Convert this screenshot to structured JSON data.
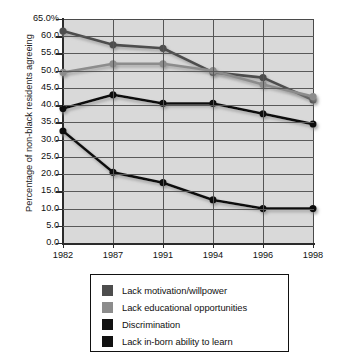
{
  "chart_data": {
    "type": "line",
    "title": "",
    "xlabel": "",
    "ylabel": "Percentage of non-black residents agreeing",
    "categories": [
      "1982",
      "1987",
      "1991",
      "1994",
      "1996",
      "1998"
    ],
    "ylim": [
      0.0,
      65.0
    ],
    "ytick_labels": [
      "65.0%",
      "60.0",
      "55.0",
      "50.0",
      "45.0",
      "40.0",
      "35.0",
      "30.0",
      "25.0",
      "20.0",
      "15.0",
      "10.0",
      "5.0",
      "0.0"
    ],
    "ytick_values": [
      65.0,
      60.0,
      55.0,
      50.0,
      45.0,
      40.0,
      35.0,
      30.0,
      25.0,
      20.0,
      15.0,
      10.0,
      5.0,
      0.0
    ],
    "grid": true,
    "legend_position": "bottom",
    "series": [
      {
        "name": "Lack motivation/willpower",
        "color": "#4d4d4d",
        "values": [
          61.5,
          57.5,
          56.5,
          49.5,
          48.0,
          41.5
        ]
      },
      {
        "name": "Lack educational opportunities",
        "color": "#8c8c8c",
        "values": [
          49.5,
          52.0,
          52.0,
          50.0,
          46.0,
          42.5
        ]
      },
      {
        "name": "Discrimination",
        "color": "#111111",
        "values": [
          39.0,
          43.0,
          40.5,
          40.5,
          37.5,
          34.5
        ]
      },
      {
        "name": "Lack in-born ability to learn",
        "color": "#111111",
        "values": [
          32.5,
          20.5,
          17.5,
          12.5,
          10.0,
          10.0
        ]
      }
    ]
  },
  "legend": {
    "items": [
      {
        "label": "Lack motivation/willpower",
        "color": "#4d4d4d"
      },
      {
        "label": "Lack educational opportunities",
        "color": "#8c8c8c"
      },
      {
        "label": "Discrimination",
        "color": "#111111"
      },
      {
        "label": "Lack in-born ability to learn",
        "color": "#111111"
      }
    ]
  },
  "colors": {
    "plot_background": "#d9d9d9",
    "gridline": "#595959",
    "axis": "#2b2b2b",
    "page_background": "#ffffff"
  }
}
